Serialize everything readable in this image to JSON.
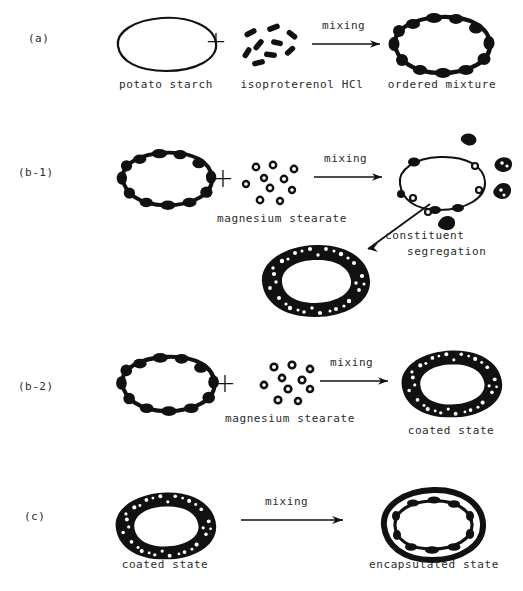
{
  "figure": {
    "background_color": "#ffffff",
    "ink_color": "#111111",
    "rows": [
      {
        "id": "a",
        "label": "(a)",
        "arrow_label": "mixing",
        "items": [
          {
            "name": "potato-starch",
            "caption": "potato starch",
            "kind": "plain-blob"
          },
          {
            "name": "isoproterenol-hcl",
            "caption": "isoproterenol HCl",
            "kind": "rod-particles"
          },
          {
            "name": "ordered-mixture",
            "caption": "ordered mixture",
            "kind": "bumpy-blob"
          }
        ]
      },
      {
        "id": "b-1",
        "label": "(b-1)",
        "arrow_label": "mixing",
        "items": [
          {
            "name": "ordered-mixture",
            "caption": "",
            "kind": "bumpy-blob"
          },
          {
            "name": "magnesium-stearate",
            "caption": "magnesium stearate",
            "kind": "ring-particles"
          },
          {
            "name": "segregated-mixture",
            "caption": "",
            "kind": "sparse-blob-with-clumps"
          },
          {
            "name": "coated-state-result",
            "caption": "",
            "kind": "granular-ring"
          }
        ],
        "secondary_arrow_label_line1": "constituent",
        "secondary_arrow_label_line2": "segregation"
      },
      {
        "id": "b-2",
        "label": "(b-2)",
        "arrow_label": "mixing",
        "items": [
          {
            "name": "ordered-mixture",
            "caption": "",
            "kind": "bumpy-blob"
          },
          {
            "name": "magnesium-stearate",
            "caption": "magnesium stearate",
            "kind": "ring-particles"
          },
          {
            "name": "coated-state",
            "caption": "coated state",
            "kind": "granular-ring"
          }
        ]
      },
      {
        "id": "c",
        "label": "(c)",
        "arrow_label": "mixing",
        "items": [
          {
            "name": "coated-state",
            "caption": "coated state",
            "kind": "granular-ring"
          },
          {
            "name": "encapsulated-state",
            "caption": "encapsulated state",
            "kind": "double-ring"
          }
        ]
      }
    ],
    "plus_symbol": "+"
  }
}
